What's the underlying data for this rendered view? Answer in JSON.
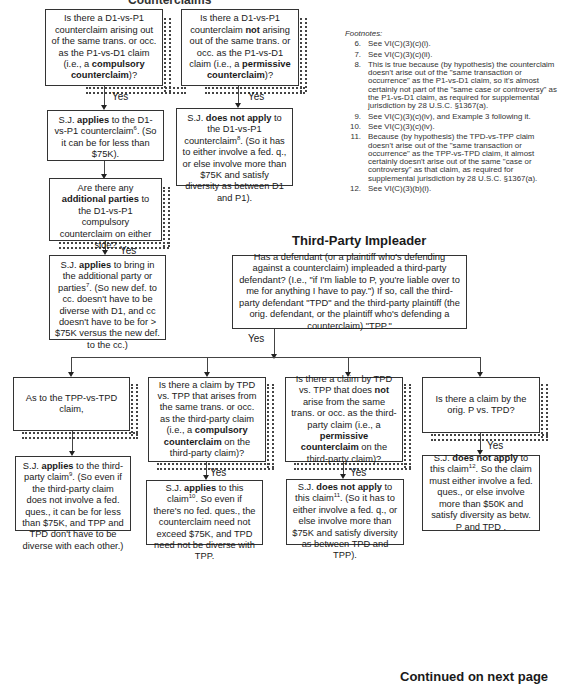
{
  "header": {
    "section_title_cut": "Counterclaims"
  },
  "counterclaims": {
    "compulsory_question": {
      "pre": "Is there a D1-vs-P1 counterclaim arising out of the same trans. or occ. as the P1-vs-D1 claim (i.e., a ",
      "bold": "compulsory counterclaim",
      "post": ")?"
    },
    "permissive_question": {
      "pre": "Is there a D1-vs-P1 counterclaim ",
      "bold1": "not",
      "mid": " arising out of the same trans. or occ. as the P1-vs-D1 claim (i.e., a ",
      "bold2": "permissive counterclaim",
      "post": ")?"
    },
    "compulsory_yes": "Yes",
    "permissive_yes": "Yes",
    "compulsory_result": {
      "pre": "S.J. ",
      "bold": "applies",
      "mid": " to the D1-vs-P1 counterclaim",
      "sup": "6",
      "post": ". (So it can be for less than $75K)."
    },
    "permissive_result": {
      "pre": "S.J. ",
      "bold": "does not apply",
      "mid": " to the D1-vs-P1 counterclaim",
      "sup": "8",
      "post": ". (So it has to either involve a fed. q., or else involve more than $75K and satisfy diversity as between D1 and P1)."
    },
    "additional_parties_question": {
      "pre": "Are there any ",
      "bold": "additional parties",
      "post": " to the D1-vs-P1 compulsory counterclaim on either side?"
    },
    "additional_yes": "Yes",
    "additional_result": {
      "pre": "S.J. ",
      "bold": "applies",
      "mid": " to bring in the additional party or parties",
      "sup": "7",
      "post": ". (So new def. to cc. doesn't have to be diverse with D1, and cc doesn't have to be for > $75K versus the new def. to the cc.)"
    }
  },
  "footnotes": {
    "heading": "Footnotes:",
    "items": [
      {
        "num": "6.",
        "text": "See VI(C)(3)(c)(i)."
      },
      {
        "num": "7.",
        "text": "See VI(C)(3)(c)(ii)."
      },
      {
        "num": "8.",
        "text": "This is true because (by hypothesis) the counterclaim doesn't arise out of the \"same transaction or occurrence\" as the P1-vs-D1 claim, so it's almost certainly not part of the \"same case or controversy\" as the P1-vs-D1 claim, as required for supplemental jurisdiction by 28 U.S.C. §1367(a)."
      },
      {
        "num": "9.",
        "text": "See VI(C)(3)(c)(iv), and Example 3 following it."
      },
      {
        "num": "10.",
        "text": "See VI(C)(3)(c)(iv)."
      },
      {
        "num": "11.",
        "text": "Because (by hypothesis) the TPD-vs-TPP claim doesn't arise out of the \"same transaction or occurrence\" as the TPP-vs-TPD claim, it almost certainly doesn't arise out of the same \"case or controversy\" as that claim, as required for supplemental jurisdiction by 28 U.S.C. §1367(a)."
      },
      {
        "num": "12.",
        "text": "See VI(C)(3)(b)(i)."
      }
    ]
  },
  "impleader": {
    "title": "Third-Party Impleader",
    "question": "Has a defendant (or a plaintiff who's defending against a counterclaim) impleaded a third-party defendant? (I.e., \"if I'm liable to P, you're liable over to me for anything I have to pay.\") If so, call the third-party defendant \"TPD\" and the third-party plaintiff (the orig. defendant, or the plaintiff who's defending a counterclaim) \"TPP.\"",
    "yes": "Yes",
    "branches": {
      "tpp_vs_tpd": {
        "question": "As to the TPP-vs-TPD claim,",
        "result": {
          "pre": "S.J. ",
          "bold": "applies",
          "mid": " to the third-party claim",
          "sup": "9",
          "post": ". (So even if the third-party claim does not involve a fed. ques., it can be for less than $75K, and TPP and TPD don't have to be diverse with each other.)"
        }
      },
      "compulsory": {
        "question": {
          "pre": "Is there a claim by TPD vs. TPP  that arises from the same trans. or occ. as the third-party claim (i.e., a ",
          "bold": "compulsory counterclaim",
          "post": " on the third-party claim)?"
        },
        "yes": "Yes",
        "result": {
          "pre": "S.J. ",
          "bold": "applies",
          "mid": " to this claim",
          "sup": "10",
          "post": ".   So even if there's no fed. ques., the counterclaim need not exceed $75K, and TPD need not be diverse with TPP."
        }
      },
      "permissive": {
        "question": {
          "pre": "Is there a claim by TPD vs. TPP  that does ",
          "bold1": "not",
          "mid": " arise from the same trans. or occ. as the third-party claim (i.e., a ",
          "bold2": "permissive counterclaim",
          "post": " on the third-party claim)?"
        },
        "yes": "Yes",
        "result": {
          "pre": "S.J. ",
          "bold": "does not apply",
          "mid": " to this claim",
          "sup": "11",
          "post": ".  (So it has to either involve a fed. q., or else involve more than $75K and satisfy diversity as between TPD and TPP)."
        }
      },
      "orig_p": {
        "question": "Is there a claim by the orig. P vs. TPD?",
        "yes": "Yes",
        "result": {
          "pre": "S.J. ",
          "bold": "does not apply",
          "mid": " to this claim",
          "sup": "12",
          "post": ".  So the claim must either involve a fed. ques., or else involve more than $50K and satisfy  diversity as betw. P and TPD ."
        }
      }
    }
  },
  "footer": {
    "continued": "Continued on next page"
  }
}
